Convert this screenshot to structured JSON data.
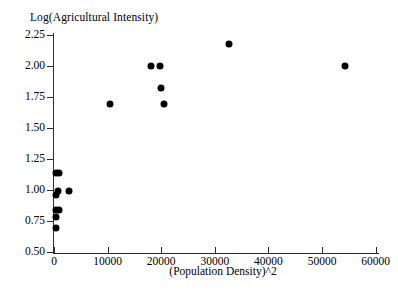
{
  "chart_data": {
    "type": "scatter",
    "title": "",
    "xlabel": "(Population Density)^2",
    "ylabel": "Log(Agricultural Intensity)",
    "xlim": [
      -1200,
      61000
    ],
    "ylim": [
      0.45,
      2.3
    ],
    "grid": false,
    "legend": null,
    "xticks": [
      0,
      10000,
      20000,
      30000,
      40000,
      50000,
      60000
    ],
    "xtick_labels": [
      "0",
      "10000",
      "20000",
      "30000",
      "40000",
      "50000",
      "60000"
    ],
    "yticks": [
      0.5,
      0.75,
      1.0,
      1.25,
      1.5,
      1.75,
      2.0,
      2.25
    ],
    "ytick_labels": [
      "0.50",
      "0.75",
      "1.00",
      "1.25",
      "1.50",
      "1.75",
      "2.00",
      "2.25"
    ],
    "marker": "filled-circle",
    "marker_color": "#000000",
    "marker_size": 7,
    "n_points": 16,
    "points": [
      {
        "x": 300,
        "y": 1.14
      },
      {
        "x": 900,
        "y": 1.14
      },
      {
        "x": 700,
        "y": 0.99
      },
      {
        "x": 300,
        "y": 0.96
      },
      {
        "x": 2800,
        "y": 0.99
      },
      {
        "x": 300,
        "y": 0.84
      },
      {
        "x": 900,
        "y": 0.84
      },
      {
        "x": 300,
        "y": 0.78
      },
      {
        "x": 400,
        "y": 0.69
      },
      {
        "x": 10400,
        "y": 1.69
      },
      {
        "x": 18000,
        "y": 2.0
      },
      {
        "x": 19700,
        "y": 2.0
      },
      {
        "x": 20000,
        "y": 1.82
      },
      {
        "x": 20500,
        "y": 1.69
      },
      {
        "x": 32700,
        "y": 2.18
      },
      {
        "x": 54200,
        "y": 2.0
      }
    ]
  }
}
